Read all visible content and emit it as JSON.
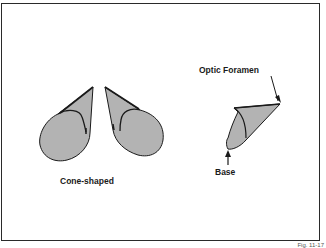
{
  "figure": {
    "labels": {
      "optic_foramen": "Optic Foramen",
      "base": "Base",
      "cone_shaped": "Cone-shaped"
    },
    "figure_number": "Fig. 11-17",
    "colors": {
      "fill": "#b3b3b3",
      "stroke": "#1a1a1a",
      "frame": "#2a2a2a",
      "background": "#ffffff"
    }
  }
}
